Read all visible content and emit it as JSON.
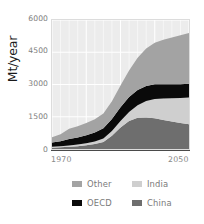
{
  "chart_data": {
    "type": "area",
    "stacked": true,
    "title": "",
    "subtitle": "",
    "xlabel": "",
    "ylabel": "Mt/year",
    "xlim": [
      1970,
      2050
    ],
    "ylim": [
      0,
      6000
    ],
    "ytick_labels": [
      "6000",
      "4500",
      "3000",
      "1500",
      "0"
    ],
    "ytick_values": [
      6000,
      4500,
      3000,
      1500,
      0
    ],
    "xtick_labels": [
      "1970",
      "2050"
    ],
    "xtick_values": [
      1970,
      2050
    ],
    "grid": true,
    "grid_color": "#ffffff",
    "plot_background": "#ececec",
    "legend_position": "bottom",
    "stack_order_bottom_to_top": [
      "China",
      "India",
      "OECD",
      "Other"
    ],
    "x": [
      1970,
      1975,
      1980,
      1985,
      1990,
      1995,
      2000,
      2005,
      2010,
      2015,
      2020,
      2025,
      2030,
      2035,
      2040,
      2045,
      2050
    ],
    "series": [
      {
        "name": "China",
        "color": "#6e6e6e",
        "values": [
          60,
          80,
          100,
          130,
          170,
          230,
          330,
          620,
          1000,
          1300,
          1450,
          1470,
          1430,
          1350,
          1280,
          1210,
          1150
        ]
      },
      {
        "name": "India",
        "color": "#cfcfcf",
        "values": [
          40,
          50,
          60,
          75,
          95,
          120,
          160,
          220,
          300,
          420,
          580,
          760,
          900,
          1000,
          1080,
          1160,
          1250
        ]
      },
      {
        "name": "OECD",
        "color": "#0a0a0a",
        "values": [
          200,
          230,
          300,
          330,
          380,
          420,
          470,
          560,
          640,
          700,
          720,
          700,
          680,
          660,
          650,
          645,
          640
        ]
      },
      {
        "name": "Other",
        "color": "#a3a3a3",
        "values": [
          250,
          330,
          480,
          520,
          560,
          610,
          690,
          820,
          1010,
          1230,
          1500,
          1750,
          1930,
          2070,
          2180,
          2270,
          2360
        ]
      }
    ],
    "totals": [
      550,
      690,
      940,
      1055,
      1205,
      1380,
      1650,
      2220,
      2950,
      3650,
      4250,
      4680,
      4940,
      5080,
      5190,
      5285,
      5400
    ]
  },
  "legend": {
    "rows": [
      {
        "left": {
          "label": "Other",
          "color": "#a3a3a3"
        },
        "right": {
          "label": "India",
          "color": "#cfcfcf"
        }
      },
      {
        "left": {
          "label": "OECD",
          "color": "#0a0a0a"
        },
        "right": {
          "label": "China",
          "color": "#6e6e6e"
        }
      }
    ]
  }
}
